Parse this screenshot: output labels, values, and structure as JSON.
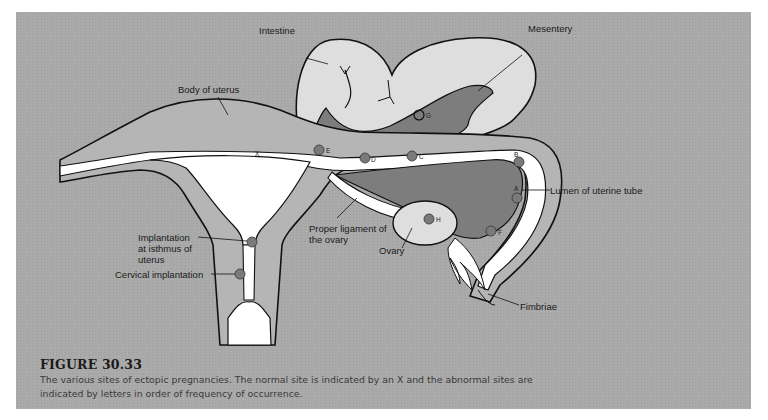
{
  "figure": {
    "number": "FIGURE 30.33",
    "caption": "The various sites of ectopic pregnancies. The normal site is indicated by an X and the abnormal sites are indicated by letters in order of frequency of occurrence."
  },
  "labels": {
    "intestine": "Intestine",
    "mesentery": "Mesentery",
    "body_of_uterus": "Body of uterus",
    "lumen_of_uterine_tube": "Lumen of uterine tube",
    "proper_ligament_line1": "Proper ligament of",
    "proper_ligament_line2": "the ovary",
    "ovary": "Ovary",
    "isthmus_line1": "Implantation",
    "isthmus_line2": "at isthmus of",
    "isthmus_line3": "uterus",
    "cervical_implantation": "Cervical implantation",
    "fimbriae": "Fimbriae"
  },
  "sites": {
    "normal": "X",
    "A": "A",
    "B": "B",
    "C": "C",
    "D": "D",
    "E": "E",
    "F": "F",
    "G": "G",
    "H": "H"
  },
  "colors": {
    "background_panel": "#a9a9a9",
    "uterus_wall": "#b5b5b5",
    "intestine": "#dedede",
    "mesentery": "#7d7d7d",
    "lumen": "#ffffff",
    "implantation_dot": "#7a7a7a",
    "outline": "#111111"
  }
}
